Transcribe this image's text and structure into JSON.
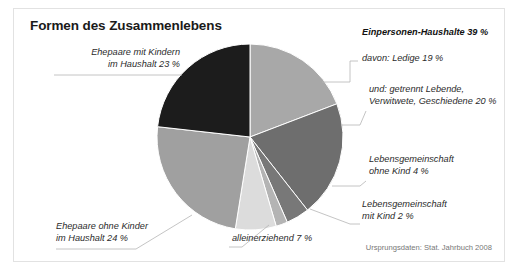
{
  "title": "Formen des Zusammenlebens",
  "source": "Ursprungsdaten: Stat. Jahrbuch 2008",
  "labels": {
    "ehepaare_mit_kindern": "Ehepaare mit Kindern\nim Haushalt 23 %",
    "einpersonen": "Einpersonen-Haushalte 39 %",
    "ledige": "davon: Ledige 19 %",
    "getrennt": "und: getrennt Lebende,\nVerwitwete, Geschiedene 20 %",
    "lg_ohne_kind": "Lebensgemeinschaft\nohne Kind 4 %",
    "lg_mit_kind": "Lebensgemeinschaft\nmit Kind 2 %",
    "alleinerziehend": "alleinerziehend 7 %",
    "ehepaare_ohne_kinder": "Ehepaare ohne Kinder\nim Haushalt 24 %"
  },
  "chart_data": {
    "type": "pie",
    "title": "Formen des Zusammenlebens",
    "unit": "%",
    "legend": "none",
    "note": "Einpersonen-Haushalte 39 % ist die Summe aus Ledige 19 % und getrennt Lebende, Verwitwete, Geschiedene 20 %",
    "categories": [
      "Ledige",
      "getrennt Lebende, Verwitwete, Geschiedene",
      "Lebensgemeinschaft ohne Kind",
      "Lebensgemeinschaft mit Kind",
      "alleinerziehend",
      "Ehepaare ohne Kinder im Haushalt",
      "Ehepaare mit Kindern im Haushalt"
    ],
    "values": [
      19,
      20,
      4,
      2,
      7,
      24,
      23
    ],
    "colors": [
      "#a8a8a8",
      "#6e6e6e",
      "#787878",
      "#b4b4b4",
      "#dcdcdc",
      "#a0a0a0",
      "#1c1c1c"
    ],
    "groups": [
      {
        "name": "Einpersonen-Haushalte",
        "value": 39,
        "members": [
          "Ledige",
          "getrennt Lebende, Verwitwete, Geschiedene"
        ]
      }
    ],
    "total": 99
  },
  "geometry": {
    "cx": 236,
    "cy": 128,
    "r": 93,
    "start_angle_deg": -90
  }
}
